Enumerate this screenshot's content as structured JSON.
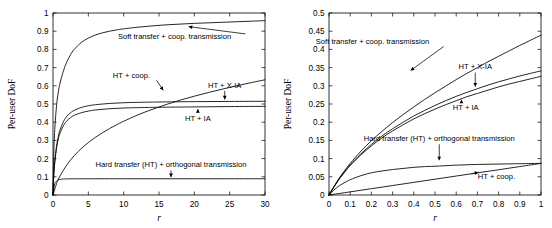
{
  "figure": {
    "title": "",
    "panel_count": 2
  },
  "chart_data": [
    {
      "panel": "left",
      "type": "line",
      "title": "",
      "xlabel": "r",
      "ylabel": "Per-user DoF",
      "xlim": [
        0,
        30
      ],
      "ylim": [
        0,
        1
      ],
      "xticks": [
        "0",
        "5",
        "10",
        "15",
        "20",
        "25",
        "30"
      ],
      "xtick_values": [
        0,
        5,
        10,
        15,
        20,
        25,
        30
      ],
      "yticks": [
        "0",
        "0.1",
        "0.2",
        "0.3",
        "0.4",
        "0.5",
        "0.6",
        "0.7",
        "0.8",
        "0.9",
        "1"
      ],
      "ytick_values": [
        0,
        0.1,
        0.2,
        0.3,
        0.4,
        0.5,
        0.6,
        0.7,
        0.8,
        0.9,
        1.0
      ],
      "grid": false,
      "legend_position": "inline-annotations",
      "series": [
        {
          "name": "Soft transfer + coop. transmission",
          "x": [
            0,
            0.1,
            0.25,
            0.5,
            0.75,
            1,
            1.5,
            2,
            2.5,
            3,
            4,
            5,
            6,
            7,
            8,
            9,
            10,
            12,
            14,
            16,
            18,
            20,
            22,
            24,
            26,
            28,
            30
          ],
          "y": [
            0,
            0.215,
            0.36,
            0.49,
            0.565,
            0.615,
            0.685,
            0.735,
            0.772,
            0.8,
            0.838,
            0.862,
            0.879,
            0.891,
            0.9,
            0.907,
            0.913,
            0.922,
            0.929,
            0.935,
            0.939,
            0.943,
            0.946,
            0.949,
            0.952,
            0.955,
            0.958
          ]
        },
        {
          "name": "HT + X-IA",
          "x": [
            0,
            0.1,
            0.25,
            0.5,
            0.75,
            1,
            1.5,
            2,
            2.5,
            3,
            4,
            5,
            6,
            8,
            10,
            12,
            15,
            20,
            25,
            30
          ],
          "y": [
            0,
            0.108,
            0.185,
            0.268,
            0.322,
            0.358,
            0.405,
            0.434,
            0.452,
            0.465,
            0.481,
            0.49,
            0.496,
            0.503,
            0.507,
            0.509,
            0.511,
            0.513,
            0.514,
            0.515
          ]
        },
        {
          "name": "HT + IA",
          "x": [
            0,
            0.1,
            0.25,
            0.5,
            0.75,
            1,
            1.5,
            2,
            2.5,
            3,
            4,
            5,
            6,
            8,
            10,
            12,
            15,
            20,
            25,
            30
          ],
          "y": [
            0,
            0.104,
            0.178,
            0.256,
            0.307,
            0.34,
            0.383,
            0.409,
            0.426,
            0.438,
            0.452,
            0.461,
            0.467,
            0.474,
            0.478,
            0.48,
            0.482,
            0.484,
            0.486,
            0.487
          ]
        },
        {
          "name": "HT + coop.",
          "x": [
            0,
            0.5,
            1,
            2,
            3,
            4,
            5,
            6,
            7,
            8,
            9,
            10,
            12,
            14,
            16,
            18,
            20,
            22,
            24,
            26,
            28,
            30
          ],
          "y": [
            0,
            0.062,
            0.105,
            0.168,
            0.216,
            0.255,
            0.288,
            0.317,
            0.342,
            0.365,
            0.386,
            0.405,
            0.44,
            0.47,
            0.497,
            0.521,
            0.543,
            0.563,
            0.582,
            0.6,
            0.617,
            0.633
          ]
        },
        {
          "name": "Hard transfer (HT) + orthogonal transmission",
          "x": [
            0,
            0.2,
            0.4,
            0.6,
            0.8,
            1,
            1.5,
            2,
            3,
            5,
            10,
            15,
            20,
            25,
            30
          ],
          "y": [
            0,
            0.055,
            0.072,
            0.08,
            0.084,
            0.086,
            0.088,
            0.0885,
            0.089,
            0.0892,
            0.0893,
            0.0893,
            0.0893,
            0.0893,
            0.0893
          ]
        }
      ],
      "annotations": [
        {
          "text": "Soft transfer + coop. transmission",
          "label_x": 17.2,
          "label_y": 0.855,
          "arrow_to_x": 19.2,
          "arrow_to_y": 0.925
        },
        {
          "text": "HT + coop.",
          "label_x": 11.1,
          "label_y": 0.645,
          "arrow_to_x": 15.6,
          "arrow_to_y": 0.575
        },
        {
          "text": "HT + X-IA",
          "label_x": 24.3,
          "label_y": 0.59,
          "arrow_to_x": 24.3,
          "arrow_to_y": 0.525
        },
        {
          "text": "HT + IA",
          "label_x": 20.5,
          "label_y": 0.405,
          "arrow_to_x": 20.5,
          "arrow_to_y": 0.472
        },
        {
          "text": "Hard transfer (HT) + orthogonal transmission",
          "label_x": 16.7,
          "label_y": 0.152,
          "arrow_to_x": 16.7,
          "arrow_to_y": 0.098
        }
      ]
    },
    {
      "panel": "right",
      "type": "line",
      "title": "",
      "xlabel": "r",
      "ylabel": "Per-user DoF",
      "xlim": [
        0,
        1
      ],
      "ylim": [
        0,
        0.5
      ],
      "xticks": [
        "0",
        "0.1",
        "0.2",
        "0.3",
        "0.4",
        "0.5",
        "0.6",
        "0.7",
        "0.8",
        "0.9",
        "1"
      ],
      "xtick_values": [
        0,
        0.1,
        0.2,
        0.3,
        0.4,
        0.5,
        0.6,
        0.7,
        0.8,
        0.9,
        1.0
      ],
      "yticks": [
        "0",
        "0.05",
        "0.1",
        "0.15",
        "0.2",
        "0.25",
        "0.3",
        "0.35",
        "0.4",
        "0.45",
        "0.5"
      ],
      "ytick_values": [
        0,
        0.05,
        0.1,
        0.15,
        0.2,
        0.25,
        0.3,
        0.35,
        0.4,
        0.45,
        0.5
      ],
      "grid": false,
      "legend_position": "inline-annotations",
      "series": [
        {
          "name": "Soft transfer + coop. transmission",
          "x": [
            0,
            0.02,
            0.05,
            0.08,
            0.1,
            0.15,
            0.2,
            0.25,
            0.3,
            0.35,
            0.4,
            0.45,
            0.5,
            0.55,
            0.6,
            0.65,
            0.7,
            0.75,
            0.8,
            0.85,
            0.9,
            0.95,
            1.0
          ],
          "y": [
            0,
            0.02,
            0.048,
            0.072,
            0.087,
            0.12,
            0.149,
            0.175,
            0.199,
            0.221,
            0.242,
            0.262,
            0.281,
            0.299,
            0.317,
            0.334,
            0.35,
            0.366,
            0.381,
            0.396,
            0.411,
            0.425,
            0.439
          ]
        },
        {
          "name": "HT + X-IA",
          "x": [
            0,
            0.02,
            0.05,
            0.08,
            0.1,
            0.15,
            0.2,
            0.25,
            0.3,
            0.35,
            0.4,
            0.45,
            0.5,
            0.55,
            0.6,
            0.65,
            0.7,
            0.75,
            0.8,
            0.85,
            0.9,
            0.95,
            1.0
          ],
          "y": [
            0,
            0.019,
            0.046,
            0.069,
            0.083,
            0.113,
            0.139,
            0.162,
            0.182,
            0.2,
            0.217,
            0.232,
            0.246,
            0.259,
            0.271,
            0.282,
            0.292,
            0.302,
            0.311,
            0.319,
            0.327,
            0.334,
            0.341
          ]
        },
        {
          "name": "HT + IA",
          "x": [
            0,
            0.02,
            0.05,
            0.08,
            0.1,
            0.15,
            0.2,
            0.25,
            0.3,
            0.35,
            0.4,
            0.45,
            0.5,
            0.55,
            0.6,
            0.65,
            0.7,
            0.75,
            0.8,
            0.85,
            0.9,
            0.95,
            1.0
          ],
          "y": [
            0,
            0.019,
            0.045,
            0.067,
            0.081,
            0.11,
            0.135,
            0.157,
            0.176,
            0.193,
            0.209,
            0.223,
            0.236,
            0.248,
            0.259,
            0.27,
            0.279,
            0.288,
            0.297,
            0.305,
            0.312,
            0.319,
            0.326
          ]
        },
        {
          "name": "Hard transfer (HT) + orthogonal transmission",
          "x": [
            0,
            0.02,
            0.05,
            0.08,
            0.1,
            0.15,
            0.2,
            0.25,
            0.3,
            0.35,
            0.4,
            0.45,
            0.5,
            0.6,
            0.7,
            0.8,
            0.9,
            1.0
          ],
          "y": [
            0,
            0.012,
            0.026,
            0.036,
            0.042,
            0.053,
            0.061,
            0.066,
            0.07,
            0.073,
            0.076,
            0.078,
            0.079,
            0.082,
            0.084,
            0.085,
            0.086,
            0.087
          ]
        },
        {
          "name": "HT + coop.",
          "x": [
            0,
            0.1,
            0.2,
            0.3,
            0.4,
            0.5,
            0.6,
            0.7,
            0.8,
            0.9,
            1.0
          ],
          "y": [
            0,
            0.0086,
            0.0173,
            0.026,
            0.0347,
            0.0434,
            0.0521,
            0.0608,
            0.0694,
            0.0781,
            0.0868
          ]
        }
      ],
      "annotations": [
        {
          "text": "Soft transfer + coop. transmission",
          "label_x": 0.205,
          "label_y": 0.415,
          "arrow_to_x": 0.385,
          "arrow_to_y": 0.342
        },
        {
          "text": "HT + X-IA",
          "label_x": 0.69,
          "label_y": 0.345,
          "arrow_to_x": 0.69,
          "arrow_to_y": 0.298
        },
        {
          "text": "HT + IA",
          "label_x": 0.645,
          "label_y": 0.233,
          "arrow_to_x": 0.625,
          "arrow_to_y": 0.262
        },
        {
          "text": "Hard transfer (HT) + orthogonal transmission",
          "label_x": 0.52,
          "label_y": 0.148,
          "arrow_to_x": 0.52,
          "arrow_to_y": 0.0955
        },
        {
          "text": "HT + coop.",
          "label_x": 0.79,
          "label_y": 0.043,
          "arrow_to_x": 0.705,
          "arrow_to_y": 0.0625
        }
      ]
    }
  ]
}
